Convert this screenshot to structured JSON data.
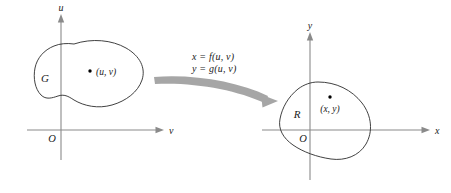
{
  "figure": {
    "background_color": "#ffffff",
    "axis_color": "#8a8a8a",
    "curve_color": "#2b2b2b",
    "arrow_color": "#a6a6a6",
    "text_color": "#1a1a1a"
  },
  "left_plane": {
    "name": "uv-plane",
    "vertical_axis_label": "u",
    "horizontal_axis_label": "v",
    "origin_label": "O",
    "region_label": "G",
    "point_label": "(u,  v)"
  },
  "mapping": {
    "equation_x": "x = f(u,  v)",
    "equation_y": "y = g(u,  v)",
    "arrow_direction": "left-to-right curved arrow"
  },
  "right_plane": {
    "name": "xy-plane",
    "vertical_axis_label": "y",
    "horizontal_axis_label": "x",
    "origin_label": "O",
    "region_label": "R",
    "point_label": "(x,  y)"
  }
}
